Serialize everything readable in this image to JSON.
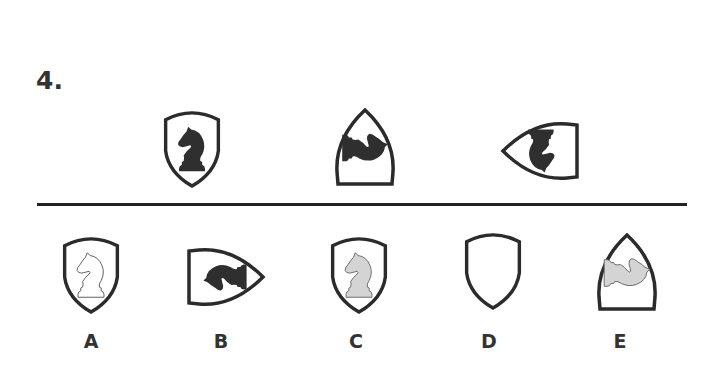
{
  "question": {
    "number": "4."
  },
  "sequence": [
    {
      "shield": "shield-upright",
      "piece": "knight",
      "rotation": 0,
      "fill": "dark"
    },
    {
      "shield": "shield-rot90",
      "piece": "knight",
      "rotation": 90,
      "fill": "dark"
    },
    {
      "shield": "shield-rot180",
      "piece": "knight",
      "rotation": 180,
      "fill": "dark"
    }
  ],
  "options": [
    {
      "label": "A",
      "shield": "shield-upright",
      "piece": "knight",
      "rotation": 0,
      "fill": "outline"
    },
    {
      "label": "B",
      "shield": "shield-rot270",
      "piece": "knight",
      "rotation": 270,
      "fill": "dark"
    },
    {
      "label": "C",
      "shield": "shield-upright",
      "piece": "knight",
      "rotation": 0,
      "fill": "light-gray"
    },
    {
      "label": "D",
      "shield": "shield-upright",
      "piece": "none",
      "rotation": 0,
      "fill": "none"
    },
    {
      "label": "E",
      "shield": "shield-rot90",
      "piece": "knight",
      "rotation": 90,
      "fill": "light-gray"
    }
  ],
  "colors": {
    "outline": "#2b2b2b",
    "dark_fill": "#2f2f2f",
    "light_fill": "#d4d4d4",
    "text": "#333333",
    "background": "#ffffff"
  }
}
